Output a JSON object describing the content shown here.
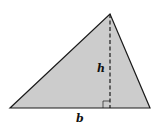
{
  "diagram": {
    "type": "triangle-area",
    "labels": {
      "height": "h",
      "base": "b"
    },
    "colors": {
      "fill": "#cccccc",
      "stroke": "#1a1a1a",
      "background": "#ffffff"
    }
  }
}
